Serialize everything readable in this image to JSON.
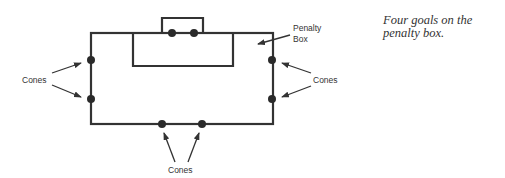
{
  "diagram": {
    "labels": {
      "penalty_box_line1": "Penalty",
      "penalty_box_line2": "Box",
      "cones_left": "Cones",
      "cones_right": "Cones",
      "cones_bottom": "Cones"
    },
    "caption": "Four goals on the penalty box.",
    "colors": {
      "line": "#333333",
      "cone": "#2a2a2a"
    }
  }
}
